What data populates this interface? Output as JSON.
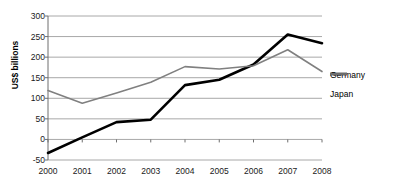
{
  "chart_data": {
    "type": "line",
    "title": "",
    "xlabel": "",
    "ylabel": "US$ billions",
    "categories": [
      "2000",
      "2001",
      "2002",
      "2003",
      "2004",
      "2005",
      "2006",
      "2007",
      "2008"
    ],
    "x": [
      2000,
      2001,
      2002,
      2003,
      2004,
      2005,
      2006,
      2007,
      2008
    ],
    "ylim": [
      -50,
      300
    ],
    "yticks": [
      300,
      250,
      200,
      150,
      100,
      50,
      0,
      -50
    ],
    "ytick_labels": [
      "300",
      "250",
      "200",
      "150",
      "100",
      "50",
      "0",
      "-50"
    ],
    "grid": "horizontal",
    "legend_position": "right",
    "series": [
      {
        "name": "Germany",
        "color": "#000000",
        "width": 2.6,
        "values": [
          -33,
          5,
          42,
          48,
          132,
          145,
          182,
          255,
          234
        ]
      },
      {
        "name": "Japan",
        "color": "#808080",
        "width": 1.6,
        "values": [
          119,
          88,
          113,
          139,
          177,
          171,
          179,
          218,
          165
        ]
      }
    ]
  },
  "legend": {
    "items": [
      {
        "label": "Germany"
      },
      {
        "label": "Japan"
      }
    ]
  },
  "colors": {
    "germany": "#000000",
    "japan": "#808080",
    "gridline": "#a8a8a8",
    "axis": "#6e6e6e",
    "text": "#1a1a1a"
  }
}
